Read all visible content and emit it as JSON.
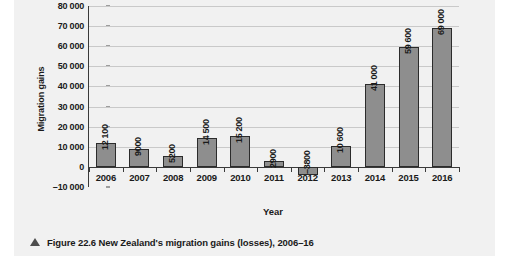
{
  "caption": {
    "marker": "triangle-up-icon",
    "text": "Figure 22.6 New Zealand's migration gains (losses), 2006–16"
  },
  "chart_data": {
    "type": "bar",
    "title": "",
    "xlabel": "Year",
    "ylabel": "Migration gains",
    "categories": [
      "2006",
      "2007",
      "2008",
      "2009",
      "2010",
      "2011",
      "2012",
      "2013",
      "2014",
      "2015",
      "2016"
    ],
    "values": [
      12100,
      9000,
      5200,
      14500,
      15200,
      2900,
      -3800,
      10600,
      41000,
      59600,
      69000
    ],
    "data_labels": [
      "12 100",
      "9000",
      "5200",
      "14 500",
      "15 200",
      "2900",
      "–3800",
      "10 600",
      "41 000",
      "59 600",
      "69 000"
    ],
    "ylim": [
      -10000,
      80000
    ],
    "ytick_values": [
      80000,
      70000,
      60000,
      50000,
      40000,
      30000,
      20000,
      10000,
      0,
      -10000
    ],
    "ytick_labels": [
      "80 000",
      "70 000",
      "60 000",
      "50 000",
      "40 000",
      "30 000",
      "20 000",
      "10 000",
      "0",
      "–10 000"
    ],
    "grid": true,
    "legend": false,
    "bar_color": "#8e8e8e",
    "bar_border_color": "#2b2b2b",
    "gridline_color": "#c9c9c9",
    "axis_color": "#3a3a3a",
    "background_color": "#f1f1f1"
  }
}
